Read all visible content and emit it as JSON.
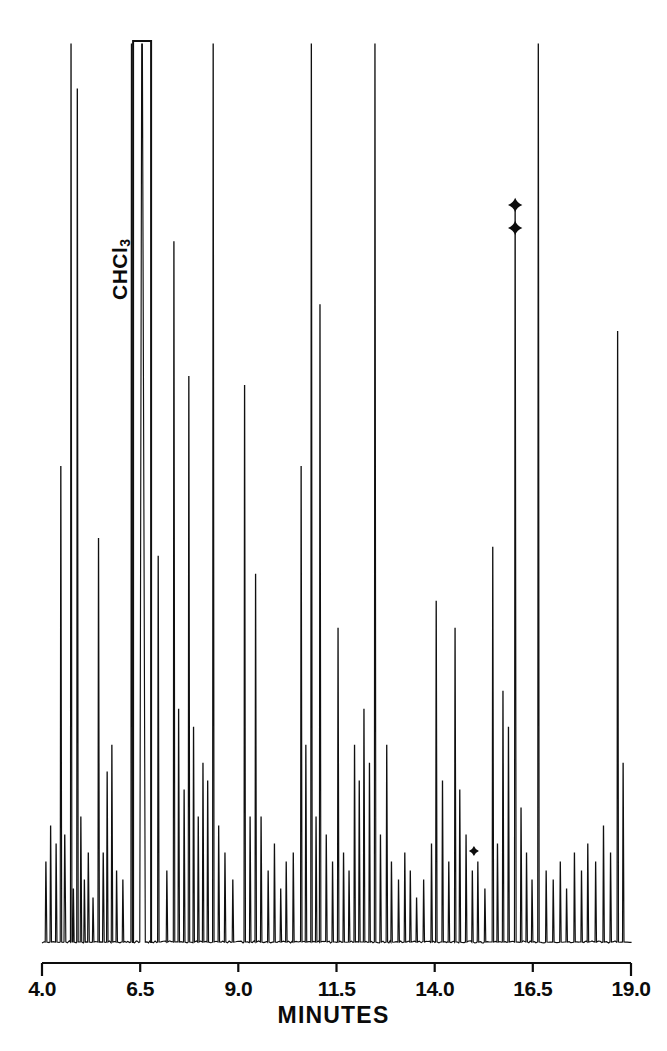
{
  "figure": {
    "kind": "gas-chromatogram",
    "background_color": "#ffffff",
    "trace_color": "#101010"
  },
  "axis": {
    "title": "MINUTES",
    "tick_labels": [
      "4.0",
      "6.5",
      "9.0",
      "11.5",
      "14.0",
      "16.5",
      "19.0"
    ],
    "tick_values": [
      4.0,
      6.5,
      9.0,
      11.5,
      14.0,
      16.5,
      19.0
    ],
    "range": [
      4.0,
      19.0
    ]
  },
  "annotations": {
    "solvent_label": "CHCl",
    "solvent_subscript": "3",
    "markers": [
      {
        "name": "marker-upper",
        "x": 16.05,
        "y_px": 205
      },
      {
        "name": "marker-lower",
        "x": 16.05,
        "y_px": 228
      },
      {
        "name": "marker-baseline",
        "x": 15.0,
        "y_px": 851
      }
    ]
  },
  "chart_data": {
    "type": "line",
    "title": "",
    "xlabel": "MINUTES",
    "ylabel": "",
    "xlim": [
      4.0,
      19.0
    ],
    "ylim": [
      0,
      100
    ],
    "grid": false,
    "legend": null,
    "series": [
      {
        "name": "detector-response",
        "comment": "peak list: [retention_time_minutes, relative_height_percent, half_width_minutes]",
        "peaks": [
          [
            4.1,
            9,
            0.018
          ],
          [
            4.22,
            13,
            0.016
          ],
          [
            4.36,
            11,
            0.016
          ],
          [
            4.48,
            53,
            0.016
          ],
          [
            4.58,
            12,
            0.02
          ],
          [
            4.74,
            100,
            0.016
          ],
          [
            4.8,
            6,
            0.014
          ],
          [
            4.9,
            95,
            0.016
          ],
          [
            4.99,
            14,
            0.016
          ],
          [
            5.08,
            7,
            0.016
          ],
          [
            5.18,
            10,
            0.018
          ],
          [
            5.3,
            5,
            0.016
          ],
          [
            5.44,
            45,
            0.016
          ],
          [
            5.56,
            10,
            0.018
          ],
          [
            5.66,
            19,
            0.016
          ],
          [
            5.78,
            22,
            0.016
          ],
          [
            5.9,
            8,
            0.016
          ],
          [
            6.06,
            7,
            0.016
          ],
          [
            6.28,
            100,
            0.016
          ],
          [
            6.55,
            112,
            0.06
          ],
          [
            6.96,
            43,
            0.016
          ],
          [
            7.18,
            8,
            0.016
          ],
          [
            7.36,
            78,
            0.016
          ],
          [
            7.48,
            26,
            0.016
          ],
          [
            7.62,
            17,
            0.016
          ],
          [
            7.74,
            63,
            0.016
          ],
          [
            7.86,
            24,
            0.016
          ],
          [
            7.98,
            14,
            0.016
          ],
          [
            8.1,
            20,
            0.016
          ],
          [
            8.22,
            18,
            0.016
          ],
          [
            8.36,
            112,
            0.016
          ],
          [
            8.5,
            13,
            0.016
          ],
          [
            8.66,
            10,
            0.016
          ],
          [
            8.86,
            7,
            0.016
          ],
          [
            9.16,
            62,
            0.016
          ],
          [
            9.3,
            14,
            0.016
          ],
          [
            9.44,
            41,
            0.016
          ],
          [
            9.58,
            14,
            0.016
          ],
          [
            9.76,
            8,
            0.016
          ],
          [
            9.92,
            11,
            0.016
          ],
          [
            10.08,
            6,
            0.016
          ],
          [
            10.22,
            9,
            0.016
          ],
          [
            10.4,
            10,
            0.016
          ],
          [
            10.6,
            53,
            0.016
          ],
          [
            10.72,
            22,
            0.016
          ],
          [
            10.86,
            112,
            0.016
          ],
          [
            10.98,
            14,
            0.016
          ],
          [
            11.08,
            71,
            0.016
          ],
          [
            11.24,
            12,
            0.016
          ],
          [
            11.4,
            9,
            0.016
          ],
          [
            11.54,
            35,
            0.016
          ],
          [
            11.68,
            10,
            0.016
          ],
          [
            11.82,
            8,
            0.016
          ],
          [
            11.96,
            22,
            0.016
          ],
          [
            12.08,
            18,
            0.016
          ],
          [
            12.2,
            26,
            0.016
          ],
          [
            12.34,
            20,
            0.016
          ],
          [
            12.48,
            112,
            0.016
          ],
          [
            12.62,
            12,
            0.016
          ],
          [
            12.78,
            22,
            0.016
          ],
          [
            12.9,
            9,
            0.016
          ],
          [
            13.08,
            7,
            0.016
          ],
          [
            13.24,
            10,
            0.016
          ],
          [
            13.38,
            8,
            0.016
          ],
          [
            13.54,
            5,
            0.016
          ],
          [
            13.72,
            7,
            0.016
          ],
          [
            13.92,
            11,
            0.016
          ],
          [
            14.04,
            38,
            0.016
          ],
          [
            14.2,
            18,
            0.016
          ],
          [
            14.36,
            9,
            0.016
          ],
          [
            14.52,
            35,
            0.016
          ],
          [
            14.64,
            17,
            0.016
          ],
          [
            14.8,
            12,
            0.016
          ],
          [
            14.96,
            8,
            0.016
          ],
          [
            15.1,
            9,
            0.016
          ],
          [
            15.28,
            6,
            0.016
          ],
          [
            15.48,
            44,
            0.016
          ],
          [
            15.6,
            11,
            0.016
          ],
          [
            15.74,
            28,
            0.016
          ],
          [
            15.88,
            24,
            0.016
          ],
          [
            16.05,
            82,
            0.018
          ],
          [
            16.2,
            15,
            0.016
          ],
          [
            16.34,
            10,
            0.016
          ],
          [
            16.48,
            7,
            0.016
          ],
          [
            16.64,
            112,
            0.016
          ],
          [
            16.84,
            8,
            0.016
          ],
          [
            17.02,
            7,
            0.016
          ],
          [
            17.2,
            9,
            0.016
          ],
          [
            17.36,
            6,
            0.016
          ],
          [
            17.56,
            10,
            0.016
          ],
          [
            17.74,
            8,
            0.016
          ],
          [
            17.9,
            11,
            0.016
          ],
          [
            18.1,
            9,
            0.016
          ],
          [
            18.3,
            13,
            0.016
          ],
          [
            18.48,
            10,
            0.016
          ],
          [
            18.66,
            68,
            0.016
          ],
          [
            18.8,
            20,
            0.016
          ]
        ]
      }
    ],
    "saturated_peaks": [
      {
        "x": 6.55,
        "note": "CHCl3 solvent peak, flat-topped / off-scale"
      }
    ]
  }
}
